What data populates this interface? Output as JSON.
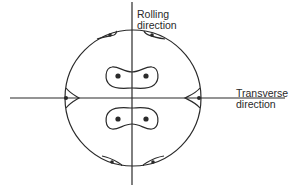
{
  "diagram": {
    "type": "pole-figure",
    "labels": {
      "rolling": [
        "Rolling",
        "direction"
      ],
      "transverse": [
        "Transverse",
        "direction"
      ]
    },
    "colors": {
      "ink": "#2a2a2a",
      "background": "#ffffff"
    },
    "circle": {
      "cx": 133,
      "cy": 98,
      "r": 68
    },
    "axes": {
      "vertical": {
        "x": 132,
        "y1": 2,
        "y2": 185
      },
      "horizontal": {
        "y": 98,
        "x1": 10,
        "x2": 285
      }
    },
    "poles": [
      {
        "name": "upper-left-center",
        "x": 118,
        "y": 76
      },
      {
        "name": "upper-right-center",
        "x": 146,
        "y": 76
      },
      {
        "name": "lower-left-center",
        "x": 118,
        "y": 119
      },
      {
        "name": "lower-right-center",
        "x": 146,
        "y": 119
      },
      {
        "name": "left-edge",
        "x": 65,
        "y": 98
      },
      {
        "name": "right-edge",
        "x": 200,
        "y": 98
      },
      {
        "name": "top-left",
        "x": 108,
        "y": 34
      },
      {
        "name": "top-right",
        "x": 152,
        "y": 34
      },
      {
        "name": "bottom-left",
        "x": 112,
        "y": 162
      },
      {
        "name": "bottom-right",
        "x": 153,
        "y": 162
      }
    ]
  }
}
